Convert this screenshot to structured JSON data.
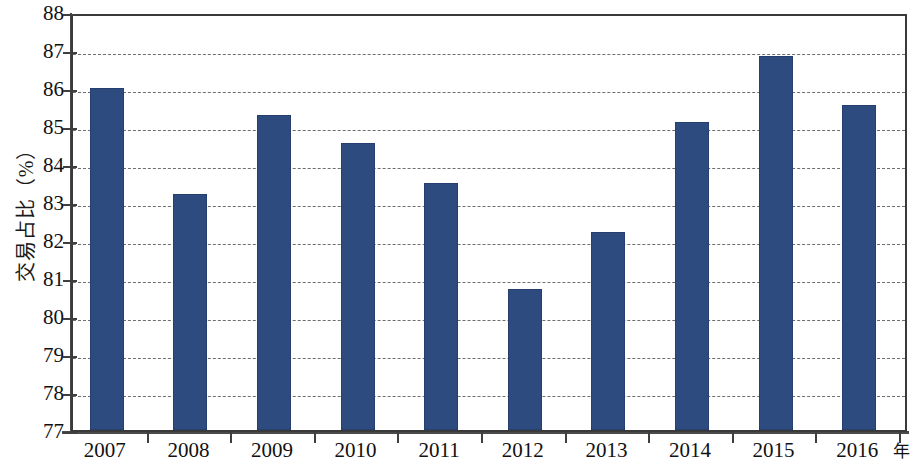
{
  "chart_data": {
    "type": "bar",
    "title": "",
    "subtitle": "",
    "xlabel": "年",
    "ylabel": "交易占比（%）",
    "categories": [
      "2007",
      "2008",
      "2009",
      "2010",
      "2011",
      "2012",
      "2013",
      "2014",
      "2015",
      "2016"
    ],
    "values": [
      86.0,
      83.2,
      85.3,
      84.55,
      83.5,
      80.7,
      82.2,
      85.1,
      86.85,
      85.55
    ],
    "series": [
      {
        "name": "交易占比",
        "values": [
          86.0,
          83.2,
          85.3,
          84.55,
          83.5,
          80.7,
          82.2,
          85.1,
          86.85,
          85.55
        ]
      }
    ],
    "ylim": [
      77,
      88
    ],
    "yticks": [
      77,
      78,
      79,
      80,
      81,
      82,
      83,
      84,
      85,
      86,
      87,
      88
    ],
    "ytick_labels": [
      "77",
      "78",
      "79",
      "80",
      "81",
      "82",
      "83",
      "84",
      "85",
      "86",
      "87",
      "88"
    ],
    "grid": "horizontal-dashed",
    "legend": "none",
    "bar_color": "#2e4b80",
    "grid_color": "#6e6e6e",
    "axis_color": "#3f3f3f",
    "background_color": "#ffffff"
  },
  "axes": {
    "y_title": "交易占比（%）",
    "x_unit": "年"
  }
}
